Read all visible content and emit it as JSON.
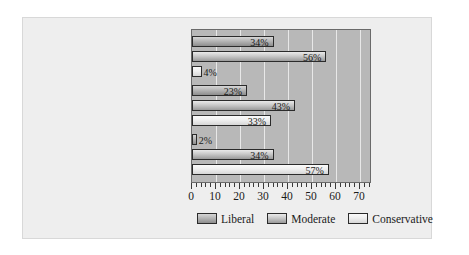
{
  "chart_data": {
    "type": "bar",
    "orientation": "horizontal",
    "title": "",
    "xlabel": "",
    "ylabel": "",
    "xlim": [
      0,
      75
    ],
    "xticks": [
      0,
      10,
      20,
      30,
      40,
      50,
      60,
      70
    ],
    "xtick_labels": [
      "0",
      "10",
      "20",
      "30",
      "40",
      "50",
      "60",
      "70"
    ],
    "grid": true,
    "grid_axis": "x",
    "legend_position": "bottom",
    "categories": [
      "Democratic Party Activists",
      "All Voters",
      "Republican Party Activists"
    ],
    "series": [
      {
        "name": "Liberal",
        "color": "#b6b6b6",
        "values": [
          34,
          23,
          2
        ],
        "labels": [
          "34%",
          "23%",
          "2%"
        ]
      },
      {
        "name": "Moderate",
        "color": "#c9c9c9",
        "values": [
          56,
          43,
          34
        ],
        "labels": [
          "56%",
          "43%",
          "34%"
        ]
      },
      {
        "name": "Conservative",
        "color": "#efefef",
        "values": [
          4,
          33,
          57
        ],
        "labels": [
          "4%",
          "33%",
          "57%"
        ]
      }
    ]
  },
  "legend": {
    "items": [
      {
        "label": "Liberal",
        "key": "liberal"
      },
      {
        "label": "Moderate",
        "key": "moderate"
      },
      {
        "label": "Conservative",
        "key": "conservative"
      }
    ]
  },
  "colors": {
    "page_background": "#ffffff",
    "card_background": "#eeeeee",
    "plot_background": "#b8b8b8",
    "gridline": "#e8e8e8",
    "bar_outline": "#2b2b2b",
    "text": "#1a1a1a"
  }
}
